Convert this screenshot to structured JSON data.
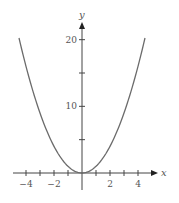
{
  "chart_data": {
    "type": "line",
    "title": "",
    "function": "y = x^2",
    "xlabel": "x",
    "ylabel": "y",
    "xlim": [
      -4.5,
      4.5
    ],
    "ylim": [
      0,
      20.25
    ],
    "x_ticks": [
      -4,
      -3,
      -2,
      -1,
      1,
      2,
      3,
      4
    ],
    "x_tick_labels": [
      {
        "value": -4,
        "label": "−4"
      },
      {
        "value": -2,
        "label": "−2"
      },
      {
        "value": 2,
        "label": "2"
      },
      {
        "value": 4,
        "label": "4"
      }
    ],
    "y_ticks": [
      5,
      10,
      15,
      20
    ],
    "y_tick_labels": [
      {
        "value": 10,
        "label": "10"
      },
      {
        "value": 20,
        "label": "20"
      }
    ],
    "grid": false,
    "legend": null,
    "series": [
      {
        "name": "y = x^2",
        "x": [
          -4.5,
          -4,
          -3,
          -2,
          -1,
          0,
          1,
          2,
          3,
          4,
          4.5
        ],
        "values": [
          20.25,
          16,
          9,
          4,
          1,
          0,
          1,
          4,
          9,
          16,
          20.25
        ]
      }
    ]
  },
  "colors": {
    "curve": "#6b6b6b",
    "axes": "#444444",
    "text": "#555555"
  }
}
